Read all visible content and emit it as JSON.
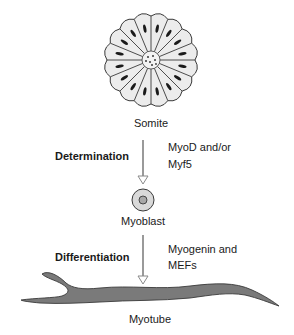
{
  "stages": {
    "somite": "Somite",
    "myoblast": "Myoblast",
    "myotube": "Myotube"
  },
  "steps": {
    "determination": {
      "process": "Determination",
      "factors_line1": "MyoD and/or",
      "factors_line2": "Myf5"
    },
    "differentiation": {
      "process": "Differentiation",
      "factors_line1": "Myogenin and",
      "factors_line2": "MEFs"
    }
  },
  "colors": {
    "somite_fill": "#ececec",
    "outline": "#3a3a3a",
    "nucleus": "#1a1a1a",
    "myoblast_fill": "#d9d9d9",
    "myotube_fill": "#7a7a7a",
    "arrow": "#9a9a9a"
  }
}
